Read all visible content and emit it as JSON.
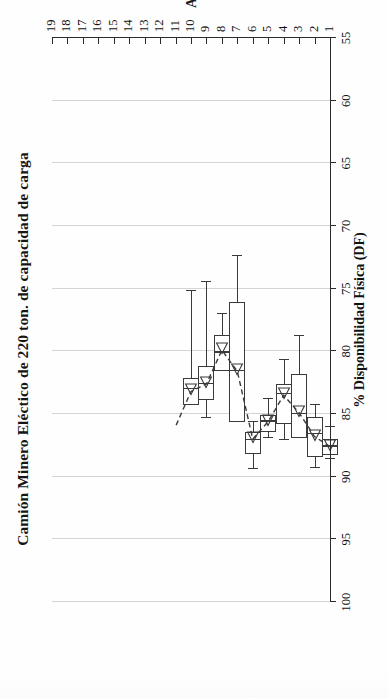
{
  "figure": {
    "title": "Camión Minero Eléctico de 220 ton. de capacidad de carga",
    "x_axis_title": "Años",
    "y_axis_title": "% Disponibilidad Física (DF)"
  },
  "chart_data": {
    "type": "box",
    "title": "Camión Minero Eléctico de 220 ton. de capacidad de carga",
    "xlabel": "Años",
    "ylabel": "% Disponibilidad Física (DF)",
    "orientation": "vertical-category-horizontal-value (page rotated 90° CCW)",
    "grid": true,
    "legend": "none",
    "xlim": [
      1,
      19
    ],
    "ylim": [
      55,
      100
    ],
    "y_ticks": [
      100,
      95,
      90,
      85,
      80,
      75,
      70,
      65,
      60,
      55
    ],
    "x_ticks": [
      1,
      2,
      3,
      4,
      5,
      6,
      7,
      8,
      9,
      10,
      11,
      12,
      13,
      14,
      15,
      16,
      17,
      18,
      19
    ],
    "categories": [
      1,
      2,
      3,
      4,
      5,
      6,
      7,
      8,
      9,
      10
    ],
    "boxes": [
      {
        "year": 1,
        "whisker_low": 86.0,
        "q1": 87.0,
        "median": 87.6,
        "q3": 88.3,
        "whisker_high": 88.6,
        "mean_marker": 87.6
      },
      {
        "year": 2,
        "whisker_low": 84.3,
        "q1": 85.2,
        "median": 86.6,
        "q3": 88.4,
        "whisker_high": 89.3,
        "mean_marker": 86.8
      },
      {
        "year": 3,
        "whisker_low": 78.8,
        "q1": 81.8,
        "median": 85.0,
        "q3": 86.9,
        "whisker_high": 86.9,
        "mean_marker": 84.9
      },
      {
        "year": 4,
        "whisker_low": 80.7,
        "q1": 82.6,
        "median": 83.4,
        "q3": 85.8,
        "whisker_high": 87.1,
        "mean_marker": 83.5
      },
      {
        "year": 5,
        "whisker_low": 83.8,
        "q1": 85.1,
        "median": 85.6,
        "q3": 86.4,
        "whisker_high": 86.9,
        "mean_marker": 85.6
      },
      {
        "year": 6,
        "whisker_low": 85.6,
        "q1": 86.4,
        "median": 87.1,
        "q3": 88.2,
        "whisker_high": 89.4,
        "mean_marker": 87.0
      },
      {
        "year": 7,
        "whisker_low": 72.4,
        "q1": 76.1,
        "median": 81.6,
        "q3": 85.6,
        "whisker_high": 85.6,
        "mean_marker": 81.6
      },
      {
        "year": 8,
        "whisker_low": 77.0,
        "q1": 78.7,
        "median": 80.1,
        "q3": 81.6,
        "whisker_high": 81.6,
        "mean_marker": 79.9
      },
      {
        "year": 9,
        "whisker_low": 74.5,
        "q1": 81.2,
        "median": 82.6,
        "q3": 83.9,
        "whisker_high": 85.3,
        "mean_marker": 82.6
      },
      {
        "year": 10,
        "whisker_low": 75.2,
        "q1": 82.1,
        "median": 83.0,
        "q3": 84.3,
        "whisker_high": 84.3,
        "mean_marker": 83.2
      }
    ],
    "trend_line": {
      "style": "dashed",
      "points": [
        {
          "year": 1,
          "value": 87.6
        },
        {
          "year": 2,
          "value": 86.8
        },
        {
          "year": 3,
          "value": 84.9
        },
        {
          "year": 4,
          "value": 83.5
        },
        {
          "year": 5,
          "value": 85.6
        },
        {
          "year": 6,
          "value": 87.0
        },
        {
          "year": 7,
          "value": 81.6
        },
        {
          "year": 8,
          "value": 79.9
        },
        {
          "year": 9,
          "value": 82.6
        },
        {
          "year": 10,
          "value": 83.2
        },
        {
          "year": 11,
          "value": 86.0
        }
      ]
    },
    "colors": {
      "line": "#3a3a3a",
      "grid": "#d9d9d9",
      "axis": "#2b2b2b",
      "box_fill": "#ffffff",
      "text": "#111111"
    }
  }
}
